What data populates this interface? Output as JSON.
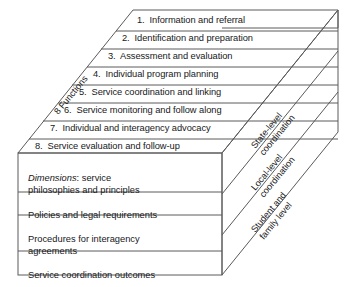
{
  "diagram": {
    "axis_label_functions": "8 Functions",
    "functions": [
      {
        "num": "1.",
        "label": "Information and referral"
      },
      {
        "num": "2.",
        "label": "Identification and preparation"
      },
      {
        "num": "3.",
        "label": "Assessment and evaluation"
      },
      {
        "num": "4.",
        "label": "Individual program planning"
      },
      {
        "num": "5.",
        "label": "Service coordination and linking"
      },
      {
        "num": "6.",
        "label": "Service monitoring and follow along"
      },
      {
        "num": "7.",
        "label": "Individual and interagency advocacy"
      },
      {
        "num": "8.",
        "label": "Service evaluation and follow-up"
      }
    ],
    "dimensions": [
      {
        "emphasis": "Dimensions",
        "rest": ": service\nphilosophies and principles"
      },
      {
        "emphasis": "",
        "rest": "Policies and legal requirements"
      },
      {
        "emphasis": "",
        "rest": "Procedures for interagency\nagreements"
      },
      {
        "emphasis": "",
        "rest": "Service coordination outcomes"
      }
    ],
    "levels": [
      "State-level\ncoordination",
      "Local-level\ncoordination",
      "Student and\nfamily level"
    ],
    "colors": {
      "stroke": "#5a5a5a",
      "text": "#17181a",
      "background": "#ffffff"
    }
  }
}
